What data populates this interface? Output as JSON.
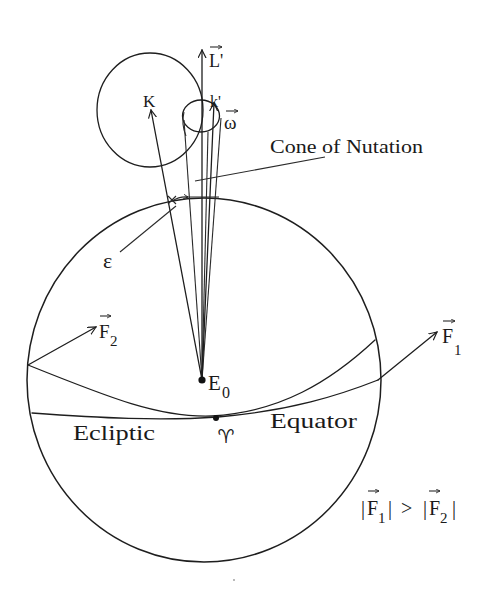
{
  "diagram": {
    "type": "physics-illustration",
    "topic": "Precession and nutation of the Earth's rotation axis"
  },
  "colors": {
    "background": "#ffffff",
    "line": "#1e1e1e",
    "text": "#1a1a1a"
  },
  "labels": {
    "L_prime": "L'",
    "K": "K",
    "k_prime": "k'",
    "omega": "ω",
    "cone_of_nutation": "Cone of Nutation",
    "epsilon": "ε",
    "F2": {
      "base": "F",
      "sub": "2"
    },
    "F1": {
      "base": "F",
      "sub": "1"
    },
    "E0": {
      "base": "E",
      "sub": "0"
    },
    "ecliptic": "Ecliptic",
    "equator": "Equator",
    "vernal_equinox": "♈",
    "inequality": {
      "bar1": "|",
      "F_a": "F",
      "sub_a": "1",
      "bar2": "|",
      "relation": ">",
      "bar3": "|",
      "F_b": "F",
      "sub_b": "2",
      "bar4": "|"
    }
  },
  "vectors": [
    {
      "name": "L'",
      "vector": true
    },
    {
      "name": "ω",
      "vector": true
    },
    {
      "name": "F1",
      "vector": true
    },
    {
      "name": "F2",
      "vector": true
    },
    {
      "name": "K",
      "vector": false
    },
    {
      "name": "k'",
      "vector": false
    }
  ],
  "relations": [
    {
      "from": "E0",
      "to": "L'",
      "kind": "arrow"
    },
    {
      "from": "E0",
      "to": "K",
      "kind": "arrow"
    },
    {
      "from": "E0",
      "to": "ω",
      "kind": "arrow"
    },
    {
      "from": "cone_of_nutation",
      "to": "cone",
      "kind": "pointer"
    },
    {
      "from": "ε",
      "to": "obliquity-angle",
      "kind": "pointer"
    },
    {
      "from": "ecliptic-left",
      "to": "F2",
      "kind": "arrow"
    },
    {
      "from": "equator-right",
      "to": "F1",
      "kind": "arrow"
    }
  ]
}
